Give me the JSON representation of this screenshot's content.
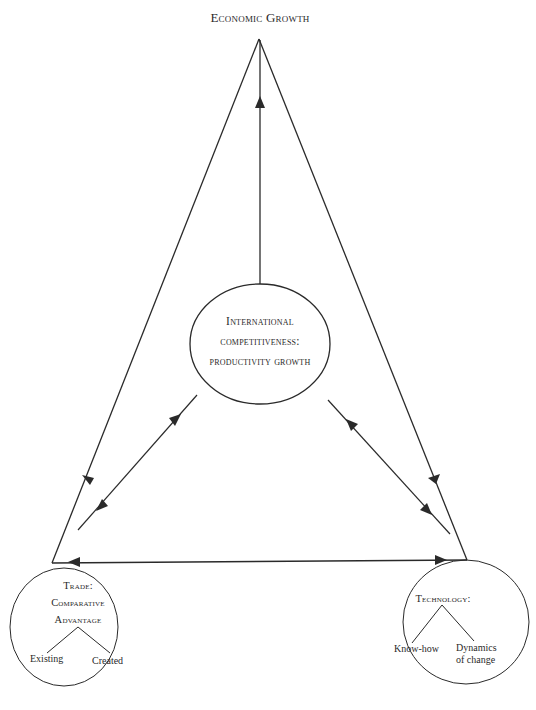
{
  "diagram": {
    "top_node": {
      "label": "Economic Growth"
    },
    "center_node": {
      "lines": [
        "International",
        "competitiveness:",
        "productivity growth"
      ]
    },
    "left_node": {
      "lines": [
        "Trade:",
        "Comparative",
        "Advantage"
      ],
      "children": [
        "Existing",
        "Created"
      ]
    },
    "right_node": {
      "lines": [
        "Technology:"
      ],
      "children": [
        "Know-how",
        [
          "Dynamics",
          "of change"
        ]
      ],
      "child_right_line1": "Dynamics",
      "child_right_line2": "of change"
    },
    "edges": [
      {
        "from": "center_node",
        "to": "top_node",
        "direction": "up"
      },
      {
        "from": "top_node",
        "to": "left_node",
        "direction": "down"
      },
      {
        "from": "top_node",
        "to": "right_node",
        "direction": "down"
      },
      {
        "from": "center_node",
        "to": "left_node",
        "direction": "bidirectional"
      },
      {
        "from": "center_node",
        "to": "right_node",
        "direction": "bidirectional"
      },
      {
        "from": "left_node",
        "to": "right_node",
        "direction": "bidirectional"
      }
    ],
    "colors": {
      "stroke": "#2a2a2a",
      "background": "#ffffff"
    }
  }
}
